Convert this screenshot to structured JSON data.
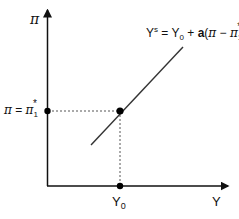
{
  "diagram": {
    "type": "supply-curve",
    "y_axis_label": "π",
    "x_axis_label": "Y",
    "curve_equation": {
      "lhs": "Y",
      "lhs_sup": "s",
      "eq": " = Y",
      "y_sub": "0",
      "plus": " + ",
      "coef": "a",
      "paren_open": "(",
      "pi": "π",
      "minus": " − ",
      "pi2": "π",
      "pi2_sub": "1",
      "pi2_sup": "*",
      "paren_close": ")"
    },
    "equilibrium_y_label": {
      "pi": "π",
      "eq": " = ",
      "pi2": "π",
      "sub": "1",
      "sup": "*"
    },
    "equilibrium_x_label": {
      "main": "Y",
      "sub": "0"
    },
    "colors": {
      "axis": "#111111",
      "curve": "#333333",
      "guide": "#555555",
      "point": "#000000"
    }
  }
}
